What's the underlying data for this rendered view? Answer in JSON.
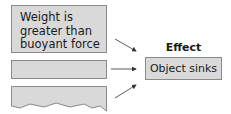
{
  "causes": [
    {
      "text": "Weight is\ngreater than\nbuoyant force"
    },
    {
      "text": ""
    },
    {
      "text": ""
    }
  ],
  "effect": {
    "heading": "Effect",
    "text": "Object sinks"
  },
  "colors": {
    "box_fill": "#d9d9d9",
    "box_border": "#8a8a8a",
    "arrow": "#333333"
  }
}
